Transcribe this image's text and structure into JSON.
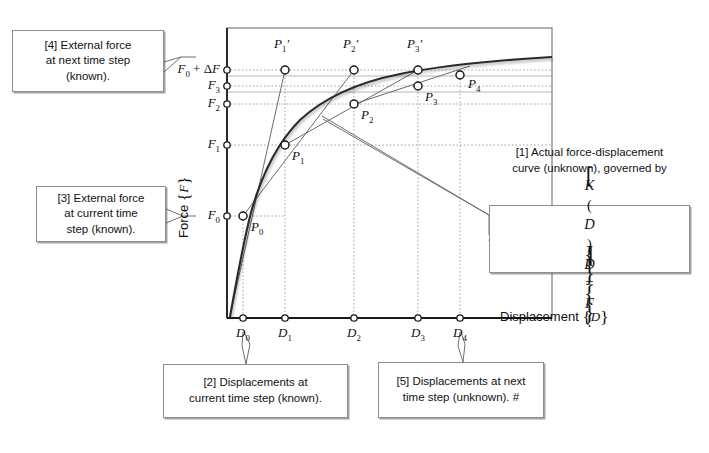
{
  "figure": {
    "type": "scientific-diagram",
    "axes": {
      "x_title_text": "Displacement",
      "x_title_symbol": "{D}",
      "y_title_text": "Force",
      "y_title_symbol": "{F}"
    },
    "y_ticks": [
      {
        "id": "f0df",
        "label": "F0 + ΔF",
        "display": "F",
        "sub": "0",
        "suffix": " + ΔF",
        "y": 70
      },
      {
        "id": "f3",
        "label": "F3",
        "display": "F",
        "sub": "3",
        "suffix": "",
        "y": 86
      },
      {
        "id": "f2",
        "label": "F2",
        "display": "F",
        "sub": "2",
        "suffix": "",
        "y": 104
      },
      {
        "id": "f1",
        "label": "F1",
        "display": "F",
        "sub": "1",
        "suffix": "",
        "y": 145
      },
      {
        "id": "f0",
        "label": "F0",
        "display": "F",
        "sub": "0",
        "suffix": "",
        "y": 216
      }
    ],
    "x_ticks": [
      {
        "id": "d0",
        "display": "D",
        "sub": "0",
        "x": 243
      },
      {
        "id": "d1",
        "display": "D",
        "sub": "1",
        "x": 285
      },
      {
        "id": "d2",
        "display": "D",
        "sub": "2",
        "x": 354
      },
      {
        "id": "d3",
        "display": "D",
        "sub": "3",
        "x": 418
      },
      {
        "id": "d4",
        "display": "D",
        "sub": "4",
        "x": 460
      }
    ],
    "points": [
      {
        "id": "p0",
        "display": "P",
        "sub": "0",
        "prime": false,
        "x": 243,
        "y": 216,
        "lx": 251,
        "ly": 221
      },
      {
        "id": "p1",
        "display": "P",
        "sub": "1",
        "prime": false,
        "x": 285,
        "y": 145,
        "lx": 293,
        "ly": 150
      },
      {
        "id": "p2",
        "display": "P",
        "sub": "2",
        "prime": false,
        "x": 354,
        "y": 104,
        "lx": 362,
        "ly": 110
      },
      {
        "id": "p3",
        "display": "P",
        "sub": "3",
        "prime": false,
        "x": 418,
        "y": 86,
        "lx": 426,
        "ly": 90
      },
      {
        "id": "p4",
        "display": "P",
        "sub": "4",
        "prime": false,
        "x": 460,
        "y": 75,
        "lx": 469,
        "ly": 78
      },
      {
        "id": "p1p",
        "display": "P",
        "sub": "1",
        "prime": true,
        "x": 285,
        "y": 70,
        "lx": 276,
        "ly": 38
      },
      {
        "id": "p2p",
        "display": "P",
        "sub": "2",
        "prime": true,
        "x": 354,
        "y": 70,
        "lx": 345,
        "ly": 38
      },
      {
        "id": "p3p",
        "display": "P",
        "sub": "3",
        "prime": true,
        "x": 418,
        "y": 70,
        "lx": 409,
        "ly": 38
      }
    ],
    "callouts": [
      {
        "id": "1",
        "tag": "[1]",
        "line1": "[1] Actual force-displacement",
        "line2": "curve (unknown), governed by",
        "equation": "[K(D)]{D} = {F}."
      },
      {
        "id": "2",
        "tag": "[2]",
        "line1": "[2] Displacements at",
        "line2": "current time step (known)."
      },
      {
        "id": "3",
        "tag": "[3]",
        "line1": "[3] External force",
        "line2": "at current time",
        "line3": "step (known)."
      },
      {
        "id": "4",
        "tag": "[4]",
        "line1": "[4] External force",
        "line2": "at next time step",
        "line3": "(known)."
      },
      {
        "id": "5",
        "tag": "[5]",
        "line1": "[5] Displacements at next",
        "line2": "time step (unknown). #"
      }
    ],
    "equation_parts": {
      "k_open": "[",
      "k_body": "K(D)",
      "k_close": "]",
      "d_open": "{",
      "d_body": "D",
      "d_close": "}",
      "eq": " = ",
      "f_open": "{",
      "f_body": "F",
      "f_close": "}",
      "period": "."
    },
    "colors": {
      "curve": "#2b2b2b",
      "secant": "#555555",
      "grid": "#9a9a9a",
      "axis": "#1a1a1a",
      "frame": "#6f6f6f",
      "box_border": "#8e8e8e",
      "marker_fill": "#ffffff",
      "background": "#ffffff"
    }
  }
}
